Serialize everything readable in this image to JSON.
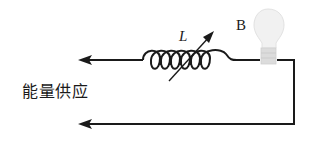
{
  "diagram": {
    "type": "circuit",
    "labels": {
      "energy_supply": "能量供应",
      "inductor": "L",
      "bulb": "B"
    },
    "components": [
      {
        "id": "inductor",
        "symbol": "variable-inductor-coil",
        "label": "L"
      },
      {
        "id": "bulb",
        "symbol": "light-bulb",
        "label": "B"
      }
    ],
    "wires": [
      {
        "id": "top-wire",
        "direction": "left",
        "terminal": "arrow"
      },
      {
        "id": "bottom-wire",
        "direction": "left",
        "terminal": "arrow"
      },
      {
        "id": "right-wire",
        "direction": "vertical"
      }
    ],
    "colors": {
      "line": "#1a1a1a",
      "bulb_glass": "#ececec",
      "bulb_base": "#d8d8d8",
      "background": "#ffffff"
    }
  }
}
